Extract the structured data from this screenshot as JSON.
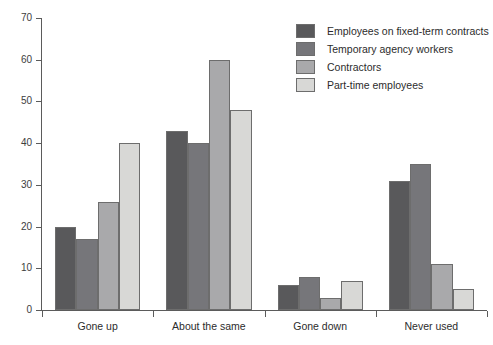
{
  "chart_data": {
    "type": "bar",
    "title": "",
    "xlabel": "",
    "ylabel": "",
    "ylim": [
      0,
      70
    ],
    "yticks": [
      0,
      10,
      20,
      30,
      40,
      50,
      60,
      70
    ],
    "grid": false,
    "legend_position": "top-right",
    "categories": [
      "Gone up",
      "About the same",
      "Gone down",
      "Never used"
    ],
    "series": [
      {
        "name": "Employees on fixed-term contracts",
        "color": "#59595b",
        "values": [
          20,
          43,
          6,
          31
        ]
      },
      {
        "name": "Temporary agency workers",
        "color": "#76767a",
        "values": [
          17,
          40,
          8,
          35
        ]
      },
      {
        "name": "Contractors",
        "color": "#a9a9ab",
        "values": [
          26,
          60,
          3,
          11
        ]
      },
      {
        "name": "Part-time employees",
        "color": "#d8d8d6",
        "values": [
          40,
          48,
          7,
          5
        ]
      }
    ]
  }
}
